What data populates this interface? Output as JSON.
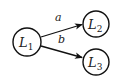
{
  "diagram": {
    "type": "directed-graph",
    "colors": {
      "stroke": "#111111",
      "fill": "#ffffff",
      "text": "#222222"
    },
    "nodes": [
      {
        "id": "L1",
        "label_main": "L",
        "label_sub": "1"
      },
      {
        "id": "L2",
        "label_main": "L",
        "label_sub": "2"
      },
      {
        "id": "L3",
        "label_main": "L",
        "label_sub": "3"
      }
    ],
    "edges": [
      {
        "from": "L1",
        "to": "L2",
        "label": "a"
      },
      {
        "from": "L1",
        "to": "L3",
        "label": "b"
      }
    ]
  }
}
